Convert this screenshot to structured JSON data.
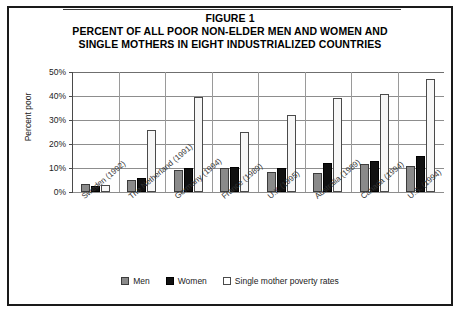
{
  "figure": {
    "title_lines": [
      "FIGURE 1",
      "PERCENT OF ALL POOR NON-ELDER MEN AND WOMEN AND",
      "SINGLE MOTHERS IN EIGHT INDUSTRIALIZED COUNTRIES"
    ]
  },
  "legend": {
    "position": "bottom-center",
    "entries": [
      {
        "label": "Men",
        "color": "#8a8a8a"
      },
      {
        "label": "Women",
        "color": "#111111"
      },
      {
        "label": "Single mother poverty rates",
        "color": "#ffffff"
      }
    ]
  },
  "axes": {
    "ylabel": "Percent poor",
    "yticks": [
      "0%",
      "10%",
      "20%",
      "30%",
      "40%",
      "50%"
    ]
  },
  "chart_data": {
    "type": "bar",
    "title": "PERCENT OF ALL POOR NON-ELDER MEN AND WOMEN AND SINGLE MOTHERS IN EIGHT INDUSTRIALIZED COUNTRIES",
    "subtitle": "FIGURE 1",
    "xlabel": "",
    "ylabel": "Percent poor",
    "ylim": [
      0,
      50
    ],
    "ytick_values": [
      0,
      10,
      20,
      30,
      40,
      50
    ],
    "ytick_labels": [
      "0%",
      "10%",
      "20%",
      "30%",
      "40%",
      "50%"
    ],
    "grid": true,
    "legend_position": "bottom",
    "categories": [
      "Sweden (1992)",
      "The Netherland (1991)",
      "Germany (1994)",
      "France (1989)",
      "U.K (1995)",
      "Australia (1989)",
      "Canada (1994)",
      "U.S. (1994)"
    ],
    "series": [
      {
        "name": "Men",
        "color": "#8a8a8a",
        "values": [
          3.5,
          5.0,
          9.0,
          10.0,
          8.5,
          8.0,
          11.5,
          11.0
        ]
      },
      {
        "name": "Women",
        "color": "#111111",
        "values": [
          2.5,
          6.0,
          10.0,
          10.5,
          10.0,
          12.0,
          13.0,
          15.0
        ]
      },
      {
        "name": "Single mother poverty rates",
        "color": "#ffffff",
        "values": [
          3.0,
          26.0,
          39.5,
          25.0,
          32.0,
          39.0,
          41.0,
          47.0
        ]
      }
    ]
  }
}
